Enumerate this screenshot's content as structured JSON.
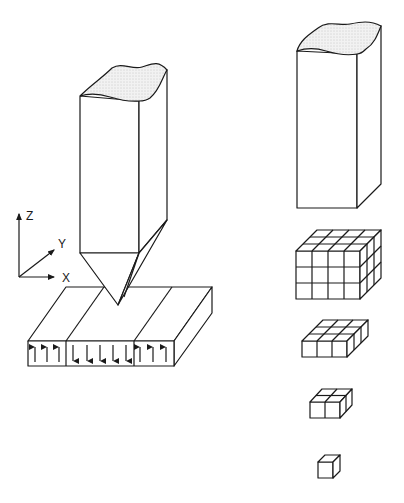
{
  "diagram": {
    "axes": {
      "z_label": "Z",
      "y_label": "Y",
      "x_label": "X"
    },
    "left_figure": {
      "description": "Probe tip above a magnetic domain slab",
      "domains": [
        {
          "direction": "up",
          "arrows": 3
        },
        {
          "direction": "down",
          "arrows": 5
        },
        {
          "direction": "up",
          "arrows": 3
        }
      ]
    },
    "right_figure": {
      "description": "Column subdivided into progressively smaller cubic blocks",
      "blocks": [
        {
          "grid": "4x3x3"
        },
        {
          "grid": "3x3x1"
        },
        {
          "grid": "2x2x1"
        },
        {
          "grid": "1x1x1"
        }
      ]
    },
    "colors": {
      "line": "#1a1a1a",
      "cut_surface": "#e6e6e6",
      "background": "#ffffff"
    }
  }
}
